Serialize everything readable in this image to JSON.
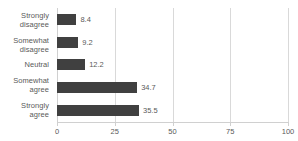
{
  "chart_data": {
    "type": "bar",
    "orientation": "horizontal",
    "title": "",
    "xlabel": "",
    "ylabel": "",
    "categories": [
      "Strongly\ndisagree",
      "Somewhat\ndisagree",
      "Neutral",
      "Somewhat\nagree",
      "Strongly\nagree"
    ],
    "values": [
      8.4,
      9.2,
      12.2,
      34.7,
      35.5
    ],
    "value_labels": [
      "8.4",
      "9.2",
      "12.2",
      "34.7",
      "35.5"
    ],
    "xlim": [
      0,
      100
    ],
    "xticks": [
      0,
      25,
      50,
      75,
      100
    ],
    "xtick_labels": [
      "0",
      "25",
      "50",
      "75",
      "100"
    ],
    "grid": "vertical",
    "legend": "none",
    "bar_color": "#404040",
    "gridline_color": "#d9d9d9",
    "text_color": "#5a5a5a",
    "background_color": "#ffffff"
  }
}
